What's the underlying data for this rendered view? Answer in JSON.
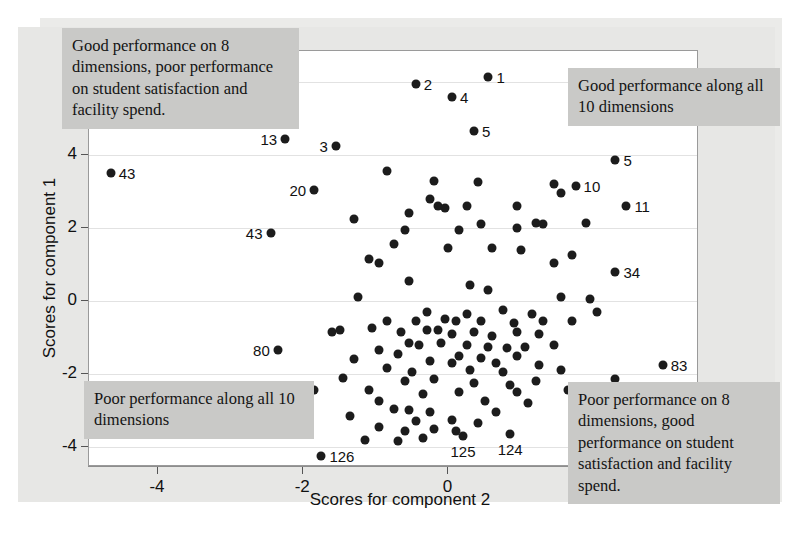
{
  "figure": {
    "kind": "scatter-plot",
    "background_color": "#e7e7e5",
    "plot_background_color": "#ffffff",
    "point_color": "#1c1c1c",
    "callout_color": "#c9c9c7"
  },
  "annotations": [
    {
      "id": "top-left",
      "text": "Good performance on 8 dimensions, poor performance on student satisfaction and facility spend."
    },
    {
      "id": "top-right",
      "text": "Good performance along all 10 dimensions"
    },
    {
      "id": "bottom-left",
      "text": "Poor performance along all 10 dimensions"
    },
    {
      "id": "bottom-right",
      "text": "Poor performance on 8 dimensions, good performance on student satisfaction and facility spend."
    }
  ],
  "chart_data": {
    "type": "scatter",
    "title": "",
    "xlabel": "Scores for component 2",
    "ylabel": "Scores for component 1",
    "xlim": [
      -4.95,
      3.45
    ],
    "ylim": [
      -4.55,
      6.85
    ],
    "xticks": [
      -4,
      -2,
      0,
      2
    ],
    "yticks": [
      6,
      4,
      2,
      0,
      -2,
      -4
    ],
    "grid": "horizontal",
    "legend": "none",
    "labelled_points": [
      {
        "label": "1",
        "x": 0.55,
        "y": 6.15,
        "label_pos": "right"
      },
      {
        "label": "2",
        "x": -0.45,
        "y": 5.95,
        "label_pos": "right"
      },
      {
        "label": "4",
        "x": 0.05,
        "y": 5.6,
        "label_pos": "right"
      },
      {
        "label": "5",
        "x": 0.35,
        "y": 4.65,
        "label_pos": "right"
      },
      {
        "label": "13",
        "x": -2.25,
        "y": 4.45,
        "label_pos": "left"
      },
      {
        "label": "3",
        "x": -1.55,
        "y": 4.25,
        "label_pos": "left"
      },
      {
        "label": "5",
        "x": 2.3,
        "y": 3.85,
        "label_pos": "right"
      },
      {
        "label": "43",
        "x": -4.65,
        "y": 3.5,
        "label_pos": "right"
      },
      {
        "label": "10",
        "x": 1.75,
        "y": 3.15,
        "label_pos": "right"
      },
      {
        "label": "20",
        "x": -1.85,
        "y": 3.05,
        "label_pos": "left"
      },
      {
        "label": "11",
        "x": 2.45,
        "y": 2.6,
        "label_pos": "right"
      },
      {
        "label": "43",
        "x": -2.45,
        "y": 1.85,
        "label_pos": "left"
      },
      {
        "label": "34",
        "x": 2.3,
        "y": 0.8,
        "label_pos": "right"
      },
      {
        "label": "80",
        "x": -2.35,
        "y": -1.35,
        "label_pos": "left"
      },
      {
        "label": "83",
        "x": 2.95,
        "y": -1.75,
        "label_pos": "right"
      },
      {
        "label": "113",
        "x": 2.6,
        "y": -3.35,
        "label_pos": "right"
      },
      {
        "label": "125",
        "x": 0.2,
        "y": -3.7,
        "label_pos": "below"
      },
      {
        "label": "124",
        "x": 0.85,
        "y": -3.65,
        "label_pos": "below"
      },
      {
        "label": "126",
        "x": -1.75,
        "y": -4.25,
        "label_pos": "right"
      }
    ],
    "points": [
      [
        0.55,
        6.15
      ],
      [
        -0.45,
        5.95
      ],
      [
        0.05,
        5.6
      ],
      [
        0.35,
        4.65
      ],
      [
        -2.25,
        4.45
      ],
      [
        -1.55,
        4.25
      ],
      [
        2.3,
        3.85
      ],
      [
        -4.65,
        3.5
      ],
      [
        1.75,
        3.15
      ],
      [
        -1.85,
        3.05
      ],
      [
        2.45,
        2.6
      ],
      [
        -2.45,
        1.85
      ],
      [
        2.3,
        0.8
      ],
      [
        -2.35,
        -1.35
      ],
      [
        2.95,
        -1.75
      ],
      [
        2.6,
        -3.35
      ],
      [
        0.2,
        -3.7
      ],
      [
        0.85,
        -3.65
      ],
      [
        -1.75,
        -4.25
      ],
      [
        -0.85,
        3.55
      ],
      [
        -0.2,
        3.3
      ],
      [
        0.4,
        3.25
      ],
      [
        1.45,
        3.2
      ],
      [
        1.55,
        2.95
      ],
      [
        -0.25,
        2.8
      ],
      [
        -0.15,
        2.6
      ],
      [
        -0.05,
        2.55
      ],
      [
        0.25,
        2.6
      ],
      [
        0.95,
        2.6
      ],
      [
        -0.55,
        2.4
      ],
      [
        0.45,
        2.1
      ],
      [
        1.2,
        2.15
      ],
      [
        1.3,
        2.1
      ],
      [
        1.9,
        2.15
      ],
      [
        -1.3,
        2.25
      ],
      [
        -0.6,
        1.95
      ],
      [
        0.15,
        1.95
      ],
      [
        0.95,
        2.0
      ],
      [
        -0.75,
        1.55
      ],
      [
        0.0,
        1.45
      ],
      [
        0.6,
        1.45
      ],
      [
        1.0,
        1.4
      ],
      [
        -1.1,
        1.15
      ],
      [
        -0.95,
        1.05
      ],
      [
        1.45,
        1.05
      ],
      [
        1.7,
        1.25
      ],
      [
        -0.55,
        0.55
      ],
      [
        0.3,
        0.45
      ],
      [
        0.55,
        0.3
      ],
      [
        -1.25,
        0.1
      ],
      [
        1.55,
        0.1
      ],
      [
        1.95,
        0.05
      ],
      [
        -0.3,
        -0.3
      ],
      [
        0.25,
        -0.35
      ],
      [
        0.75,
        -0.25
      ],
      [
        1.15,
        -0.35
      ],
      [
        2.05,
        -0.3
      ],
      [
        -0.85,
        -0.55
      ],
      [
        -0.45,
        -0.55
      ],
      [
        -0.05,
        -0.5
      ],
      [
        0.1,
        -0.55
      ],
      [
        0.45,
        -0.55
      ],
      [
        0.9,
        -0.6
      ],
      [
        1.3,
        -0.55
      ],
      [
        1.7,
        -0.55
      ],
      [
        -1.05,
        -0.75
      ],
      [
        -0.65,
        -0.85
      ],
      [
        -0.3,
        -0.8
      ],
      [
        -0.15,
        -0.8
      ],
      [
        0.05,
        -0.9
      ],
      [
        0.35,
        -0.85
      ],
      [
        0.6,
        -0.95
      ],
      [
        0.95,
        -0.85
      ],
      [
        1.25,
        -0.9
      ],
      [
        -1.6,
        -0.85
      ],
      [
        -1.5,
        -0.8
      ],
      [
        -0.55,
        -1.15
      ],
      [
        -0.4,
        -1.2
      ],
      [
        -0.1,
        -1.15
      ],
      [
        0.25,
        -1.2
      ],
      [
        0.55,
        -1.25
      ],
      [
        0.8,
        -1.3
      ],
      [
        1.05,
        -1.25
      ],
      [
        1.45,
        -1.2
      ],
      [
        -0.95,
        -1.35
      ],
      [
        -0.7,
        -1.45
      ],
      [
        0.15,
        -1.5
      ],
      [
        0.45,
        -1.55
      ],
      [
        0.95,
        -1.5
      ],
      [
        -1.3,
        -1.6
      ],
      [
        -0.25,
        -1.65
      ],
      [
        0.05,
        -1.7
      ],
      [
        0.65,
        -1.7
      ],
      [
        1.25,
        -1.75
      ],
      [
        -0.85,
        -1.85
      ],
      [
        -0.5,
        -1.95
      ],
      [
        0.3,
        -1.9
      ],
      [
        0.75,
        -1.95
      ],
      [
        1.55,
        -1.9
      ],
      [
        -1.45,
        -2.1
      ],
      [
        -0.6,
        -2.2
      ],
      [
        -0.2,
        -2.15
      ],
      [
        0.35,
        -2.25
      ],
      [
        0.85,
        -2.3
      ],
      [
        1.2,
        -2.2
      ],
      [
        2.3,
        -2.15
      ],
      [
        -1.1,
        -2.45
      ],
      [
        -0.35,
        -2.55
      ],
      [
        0.15,
        -2.5
      ],
      [
        0.95,
        -2.5
      ],
      [
        1.65,
        -2.45
      ],
      [
        -1.85,
        -2.45
      ],
      [
        -0.95,
        -2.75
      ],
      [
        0.5,
        -2.75
      ],
      [
        1.1,
        -2.8
      ],
      [
        -0.75,
        -2.95
      ],
      [
        -0.55,
        -3.0
      ],
      [
        -0.25,
        -3.05
      ],
      [
        0.65,
        -3.05
      ],
      [
        -1.35,
        -3.15
      ],
      [
        -0.45,
        -3.3
      ],
      [
        0.05,
        -3.25
      ],
      [
        0.4,
        -3.35
      ],
      [
        -0.95,
        -3.45
      ],
      [
        -0.6,
        -3.55
      ],
      [
        -0.2,
        -3.5
      ],
      [
        0.1,
        -3.55
      ],
      [
        -1.15,
        -3.8
      ],
      [
        -0.7,
        -3.85
      ],
      [
        -0.35,
        -3.75
      ]
    ]
  }
}
